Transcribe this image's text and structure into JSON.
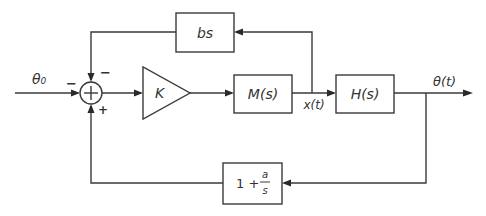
{
  "diagram": {
    "type": "control-system-block-diagram",
    "input": {
      "label": "θ₀"
    },
    "output": {
      "label": "θ(t)"
    },
    "summing_junction": {
      "signs": {
        "left": "−",
        "top": "−",
        "bottom": "+"
      }
    },
    "blocks": {
      "gain": {
        "label": "K",
        "shape": "triangle"
      },
      "motor": {
        "label": "M(s)"
      },
      "plant": {
        "label": "H(s)"
      },
      "derivative_feedback": {
        "label": "bs"
      },
      "pi_feedback": {
        "label_whole": "1 +",
        "numerator": "a",
        "denominator": "s"
      }
    },
    "signals": {
      "intermediate": {
        "label": "x(t)"
      }
    },
    "colors": {
      "line": "#3a3a3a",
      "background": "#ffffff"
    }
  }
}
